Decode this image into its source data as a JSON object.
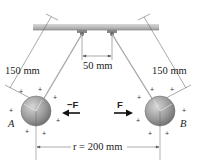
{
  "diagram": {
    "labels": {
      "left_string_length": "150 mm",
      "right_string_length": "150 mm",
      "support_spacing": "50 mm",
      "separation": "r = 200 mm",
      "sphere_left": "A",
      "sphere_right": "B",
      "force_left": "−F",
      "force_right": "F"
    },
    "colors": {
      "sphere": "#9a9a9a",
      "sphere_highlight": "#cfcfcf",
      "ceiling": "#b8b8b8",
      "string": "#a8a8a8",
      "line": "#444444"
    },
    "charges": "+"
  }
}
